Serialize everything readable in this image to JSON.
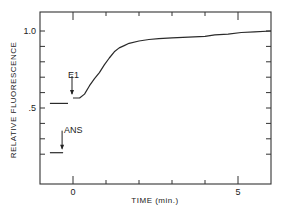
{
  "chart_data": {
    "type": "line",
    "title": "",
    "xlabel": "TIME (min.)",
    "ylabel": "RELATIVE FLUORESCENCE",
    "xlim": [
      -1,
      6
    ],
    "ylim": [
      0,
      1.15
    ],
    "x_tick_labels": [
      {
        "value": 0,
        "label": "0"
      },
      {
        "value": 5,
        "label": "5"
      }
    ],
    "x_ticks_minor": [
      1,
      2,
      3,
      4
    ],
    "y_tick_labels": [
      {
        "value": 0.5,
        "label": ".5"
      },
      {
        "value": 1.0,
        "label": "1.0"
      }
    ],
    "y_ticks_minor": [
      0.2,
      0.3,
      0.4,
      0.6,
      0.7,
      0.8,
      0.9
    ],
    "grid": false,
    "legend": null,
    "series": [
      {
        "name": "ANS baseline",
        "x": [
          -0.7,
          -0.3
        ],
        "y": [
          0.21,
          0.21
        ]
      },
      {
        "name": "Before E1",
        "x": [
          -0.7,
          -0.15
        ],
        "y": [
          0.53,
          0.53
        ]
      },
      {
        "name": "After E1",
        "x": [
          0.0,
          0.2,
          0.35,
          0.5,
          0.65,
          0.8,
          0.95,
          1.1,
          1.25,
          1.4,
          1.55,
          1.7,
          2.0,
          2.3,
          2.6,
          3.0,
          3.5,
          4.0,
          4.3,
          4.7,
          5.1,
          5.5,
          6.0
        ],
        "y": [
          0.565,
          0.565,
          0.59,
          0.645,
          0.69,
          0.73,
          0.78,
          0.825,
          0.865,
          0.89,
          0.905,
          0.92,
          0.935,
          0.945,
          0.95,
          0.955,
          0.96,
          0.965,
          0.975,
          0.98,
          0.99,
          0.995,
          1.0
        ]
      }
    ],
    "annotations": [
      {
        "text": "ANS",
        "x": -0.3,
        "y": 0.21,
        "arrow": "down"
      },
      {
        "text": "E1",
        "x": 0.0,
        "y": 0.565,
        "arrow": "down"
      }
    ]
  }
}
